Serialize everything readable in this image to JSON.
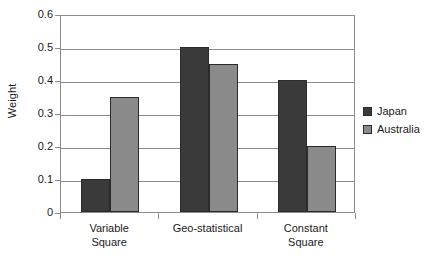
{
  "chart_data": {
    "type": "bar",
    "title": "",
    "xlabel": "",
    "ylabel": "Weight",
    "categories": [
      "Variable\nSquare",
      "Geo-statistical",
      "Constant\nSquare"
    ],
    "category_lines": [
      [
        "Variable",
        "Square"
      ],
      [
        "Geo-statistical"
      ],
      [
        "Constant",
        "Square"
      ]
    ],
    "series": [
      {
        "name": "Japan",
        "color": "#3a3a3a",
        "values": [
          0.1,
          0.5,
          0.4
        ]
      },
      {
        "name": "Australia",
        "color": "#8a8a8a",
        "values": [
          0.35,
          0.45,
          0.2
        ]
      }
    ],
    "ylim": [
      0,
      0.6
    ],
    "ytick_values": [
      0,
      0.1,
      0.2,
      0.3,
      0.4,
      0.5,
      0.6
    ],
    "ytick_labels": [
      "0",
      "0.1",
      "0.2",
      "0.3",
      "0.4",
      "0.5",
      "0.6"
    ],
    "grid": true,
    "grid_color": "#8c8c8c",
    "legend_position": "right",
    "bar_border_color": "#2b2b2b",
    "background": "#ffffff"
  },
  "legend": {
    "items": [
      {
        "label": "Japan"
      },
      {
        "label": "Australia"
      }
    ]
  },
  "axis": {
    "y_title": "Weight"
  }
}
